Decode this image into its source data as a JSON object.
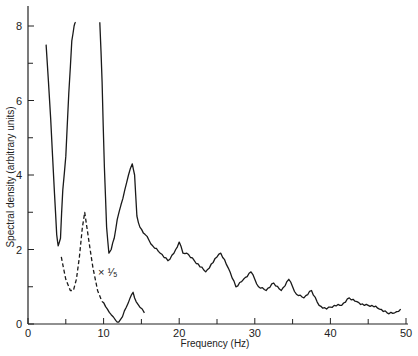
{
  "chart_data": {
    "type": "line",
    "title": "",
    "xlabel": "Frequency (Hz)",
    "ylabel": "Spectral density (arbitrary units)",
    "xlim": [
      0,
      50
    ],
    "ylim": [
      0,
      8.5
    ],
    "x_ticks_major": [
      0,
      10,
      20,
      30,
      40,
      50
    ],
    "x_ticks_minor": [
      5,
      15,
      25,
      35,
      45
    ],
    "y_ticks_major": [
      0,
      2,
      4,
      6,
      8
    ],
    "y_ticks_minor": [
      1,
      3,
      5,
      7
    ],
    "grid": false,
    "annotation": "× 1/5",
    "series": [
      {
        "name": "solid spectrum",
        "style": "solid",
        "x": [
          2.4,
          3.0,
          3.5,
          3.8,
          4.0,
          4.3,
          4.6,
          5.0,
          5.4,
          5.8,
          6.1,
          6.3,
          9.5,
          9.8,
          10.1,
          10.4,
          10.7,
          11.0,
          11.4,
          11.8,
          12.3,
          12.8,
          13.3,
          13.8,
          14.1,
          14.4,
          14.8,
          15.5,
          16.5,
          17.5,
          18.5,
          19.3,
          20.0,
          20.5,
          21.0,
          22.0,
          23.5,
          25.0,
          25.5,
          26.5,
          27.5,
          28.5,
          29.5,
          30.5,
          31.5,
          32.5,
          33.5,
          34.5,
          35.5,
          36.5,
          37.5,
          38.5,
          39.5,
          40.5,
          41.5,
          42.5,
          43.5,
          44.5,
          45.5,
          46.5,
          47.5,
          48.5,
          49.3
        ],
        "y": [
          7.5,
          5.5,
          3.5,
          2.4,
          2.1,
          2.3,
          3.6,
          4.5,
          6.2,
          7.6,
          8.0,
          8.1,
          8.1,
          6.5,
          4.2,
          2.6,
          1.9,
          2.0,
          2.3,
          2.8,
          3.2,
          3.6,
          4.0,
          4.3,
          4.0,
          2.9,
          2.6,
          2.4,
          2.1,
          1.9,
          1.7,
          1.9,
          2.2,
          1.9,
          1.9,
          1.7,
          1.4,
          1.8,
          1.9,
          1.5,
          1.0,
          1.2,
          1.4,
          1.0,
          0.9,
          1.1,
          0.9,
          1.2,
          0.8,
          0.7,
          0.9,
          0.5,
          0.4,
          0.5,
          0.5,
          0.7,
          0.6,
          0.5,
          0.5,
          0.4,
          0.3,
          0.3,
          0.4
        ]
      },
      {
        "name": "dashed spectrum (× 1/5)",
        "style": "dashed",
        "scale_factor": 0.2,
        "x": [
          4.4,
          5.0,
          5.6,
          6.0,
          6.4,
          6.8,
          7.2,
          7.5,
          8.0,
          8.6,
          9.2,
          9.8,
          10.5,
          11.0,
          11.6,
          12.0,
          12.5,
          13.0,
          13.5,
          13.9,
          14.3,
          14.8,
          15.4
        ],
        "y": [
          1.8,
          1.2,
          0.9,
          0.9,
          1.2,
          1.8,
          2.6,
          3.0,
          2.3,
          1.5,
          0.9,
          0.6,
          0.4,
          0.25,
          0.1,
          0.05,
          0.2,
          0.45,
          0.7,
          0.85,
          0.6,
          0.45,
          0.3
        ]
      }
    ]
  },
  "axes": {
    "x_label": "Frequency (Hz)",
    "y_label": "Spectral density (arbitrary units)",
    "annotation": "× ¹⁄₅",
    "x_tick_labels": [
      "0",
      "10",
      "20",
      "30",
      "40",
      "50"
    ],
    "y_tick_labels": [
      "0",
      "2",
      "4",
      "6",
      "8"
    ]
  }
}
